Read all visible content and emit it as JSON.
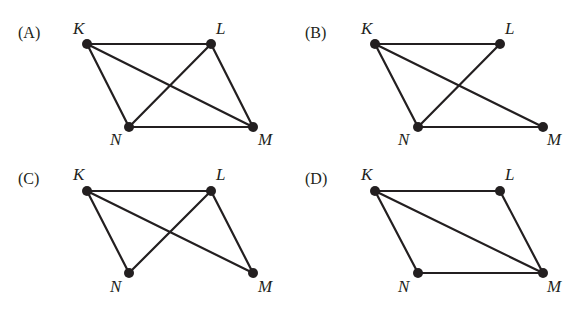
{
  "panels": [
    {
      "id": "A",
      "label": "(A)",
      "label_pos": [
        18,
        38
      ],
      "nodes": {
        "K": {
          "x": 87,
          "y": 44,
          "label": "K",
          "lx": 73,
          "ly": 34
        },
        "L": {
          "x": 211,
          "y": 44,
          "label": "L",
          "lx": 216,
          "ly": 34
        },
        "N": {
          "x": 129,
          "y": 127,
          "label": "N",
          "lx": 110,
          "ly": 145
        },
        "M": {
          "x": 253,
          "y": 127,
          "label": "M",
          "lx": 258,
          "ly": 145
        }
      },
      "edges": [
        [
          "K",
          "L"
        ],
        [
          "K",
          "N"
        ],
        [
          "K",
          "M"
        ],
        [
          "L",
          "N"
        ],
        [
          "L",
          "M"
        ],
        [
          "N",
          "M"
        ]
      ]
    },
    {
      "id": "B",
      "label": "(B)",
      "label_pos": [
        305,
        38
      ],
      "nodes": {
        "K": {
          "x": 375,
          "y": 44,
          "label": "K",
          "lx": 361,
          "ly": 34
        },
        "L": {
          "x": 500,
          "y": 44,
          "label": "L",
          "lx": 505,
          "ly": 34
        },
        "N": {
          "x": 418,
          "y": 127,
          "label": "N",
          "lx": 398,
          "ly": 145
        },
        "M": {
          "x": 543,
          "y": 127,
          "label": "M",
          "lx": 547,
          "ly": 145
        }
      },
      "edges": [
        [
          "K",
          "L"
        ],
        [
          "K",
          "N"
        ],
        [
          "K",
          "M"
        ],
        [
          "L",
          "N"
        ],
        [
          "N",
          "M"
        ]
      ]
    },
    {
      "id": "C",
      "label": "(C)",
      "label_pos": [
        18,
        184
      ],
      "nodes": {
        "K": {
          "x": 87,
          "y": 191,
          "label": "K",
          "lx": 73,
          "ly": 180
        },
        "L": {
          "x": 211,
          "y": 191,
          "label": "L",
          "lx": 216,
          "ly": 180
        },
        "N": {
          "x": 129,
          "y": 273,
          "label": "N",
          "lx": 110,
          "ly": 292
        },
        "M": {
          "x": 253,
          "y": 273,
          "label": "M",
          "lx": 258,
          "ly": 292
        }
      },
      "edges": [
        [
          "K",
          "L"
        ],
        [
          "K",
          "N"
        ],
        [
          "K",
          "M"
        ],
        [
          "L",
          "N"
        ],
        [
          "L",
          "M"
        ]
      ]
    },
    {
      "id": "D",
      "label": "(D)",
      "label_pos": [
        305,
        184
      ],
      "nodes": {
        "K": {
          "x": 375,
          "y": 191,
          "label": "K",
          "lx": 361,
          "ly": 180
        },
        "L": {
          "x": 500,
          "y": 191,
          "label": "L",
          "lx": 505,
          "ly": 180
        },
        "N": {
          "x": 418,
          "y": 273,
          "label": "N",
          "lx": 398,
          "ly": 292
        },
        "M": {
          "x": 543,
          "y": 273,
          "label": "M",
          "lx": 547,
          "ly": 292
        }
      },
      "edges": [
        [
          "K",
          "L"
        ],
        [
          "K",
          "N"
        ],
        [
          "K",
          "M"
        ],
        [
          "L",
          "M"
        ],
        [
          "N",
          "M"
        ]
      ]
    }
  ],
  "style": {
    "ink": "#231f20",
    "node_radius": 5
  }
}
